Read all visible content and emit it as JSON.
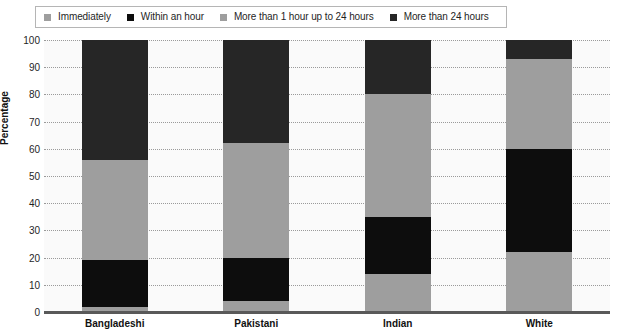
{
  "chart_data": {
    "type": "bar",
    "subtype": "stacked-bar-100",
    "title": "",
    "xlabel": "",
    "ylabel": "Percentage",
    "ylim": [
      0,
      100
    ],
    "ytick_step": 10,
    "yticks": [
      100,
      90,
      80,
      70,
      60,
      50,
      40,
      30,
      20,
      10,
      0
    ],
    "grid": true,
    "legend_position": "top",
    "categories": [
      "Bangladeshi",
      "Pakistani",
      "Indian",
      "White"
    ],
    "series": [
      {
        "name": "Immediately",
        "color": "#9e9e9e",
        "values": [
          2,
          4,
          14,
          22
        ]
      },
      {
        "name": "Within an hour",
        "color": "#0d0d0d",
        "values": [
          17,
          16,
          21,
          38
        ]
      },
      {
        "name": "More than 1 hour up to 24 hours",
        "color": "#9e9e9e",
        "values": [
          37,
          42,
          45,
          33
        ]
      },
      {
        "name": "More than 24 hours",
        "color": "#262626",
        "values": [
          44,
          38,
          20,
          7
        ]
      }
    ],
    "cumulative_boundaries": {
      "Bangladeshi": [
        0,
        2,
        19,
        56,
        100
      ],
      "Pakistani": [
        0,
        4,
        20,
        62,
        100
      ],
      "Indian": [
        0,
        14,
        35,
        80,
        100
      ],
      "White": [
        0,
        22,
        60,
        93,
        100
      ]
    }
  },
  "legend": {
    "items": [
      {
        "label": "Immediately",
        "color": "#9e9e9e"
      },
      {
        "label": "Within an hour",
        "color": "#0d0d0d"
      },
      {
        "label": "More than 1 hour up to 24 hours",
        "color": "#9e9e9e"
      },
      {
        "label": "More than 24 hours",
        "color": "#262626"
      }
    ]
  },
  "axes": {
    "y_title": "Percentage",
    "y_labels": [
      "100",
      "90",
      "80",
      "70",
      "60",
      "50",
      "40",
      "30",
      "20",
      "10",
      "0"
    ],
    "x_labels": [
      "Bangladeshi",
      "Pakistani",
      "Indian",
      "White"
    ]
  },
  "colors": {
    "plot_background": "#fafafa",
    "gridline": "#9a9a9a",
    "axis": "#595959",
    "legend_border": "#b5b5b5",
    "text": "#1f1f1f"
  }
}
